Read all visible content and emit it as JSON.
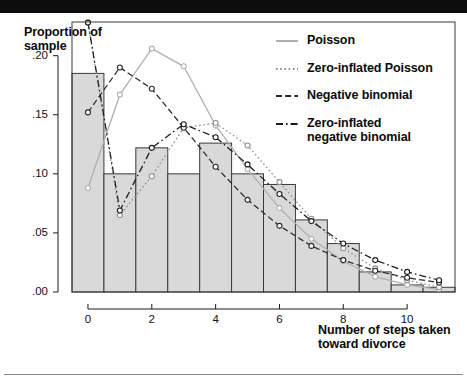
{
  "figure": {
    "y_axis_title": "Proportion\nof sample",
    "x_axis_title": "Number of steps\ntaken toward\ndivorce"
  },
  "legend": {
    "items": [
      {
        "label": "Poisson",
        "style": "solid",
        "color": "#b0b0b0"
      },
      {
        "label": "Zero-inflated Poisson",
        "style": "dotted",
        "color": "#8f8f8f"
      },
      {
        "label": "Negative binomial",
        "style": "dashed",
        "color": "#2a2a2a"
      },
      {
        "label": "Zero-inflated\nnegative binomial",
        "style": "dashdot",
        "color": "#1a1a1a"
      }
    ]
  },
  "chart_data": {
    "type": "bar",
    "title": "",
    "xlabel": "Number of steps taken toward divorce",
    "ylabel": "Proportion of sample",
    "categories": [
      0,
      1,
      2,
      3,
      4,
      5,
      6,
      7,
      8,
      9,
      10,
      11
    ],
    "values": [
      0.185,
      0.1,
      0.122,
      0.1,
      0.126,
      0.1,
      0.091,
      0.061,
      0.041,
      0.017,
      0.006,
      0.004
    ],
    "xlim": [
      -0.5,
      11.5
    ],
    "ylim": [
      0.0,
      0.2285
    ],
    "ytick_values": [
      0.0,
      0.05,
      0.1,
      0.15,
      0.2
    ],
    "ytick_labels": [
      ".00",
      ".05",
      ".10",
      ".15",
      ".20"
    ],
    "xtick_values": [
      0,
      2,
      4,
      6,
      8,
      10
    ],
    "xtick_labels": [
      "0",
      "2",
      "4",
      "6",
      "8",
      "10"
    ],
    "grid": false,
    "bar_fill": "#d9d9d9",
    "bar_edge": "#3a3a3a",
    "series": [
      {
        "name": "Poisson",
        "style": "solid",
        "color": "#b0b0b0",
        "x": [
          0,
          1,
          2,
          3,
          4,
          5,
          6,
          7,
          8,
          9,
          10,
          11
        ],
        "values": [
          0.088,
          0.167,
          0.206,
          0.191,
          0.141,
          0.104,
          0.071,
          0.045,
          0.026,
          0.013,
          0.006,
          0.002
        ]
      },
      {
        "name": "Zero-inflated Poisson",
        "style": "dotted",
        "color": "#8f8f8f",
        "x": [
          0,
          1,
          2,
          3,
          4,
          5,
          6,
          7,
          8,
          9,
          10,
          11
        ],
        "values": [
          0.228,
          0.065,
          0.098,
          0.139,
          0.143,
          0.124,
          0.093,
          0.062,
          0.037,
          0.02,
          0.01,
          0.004
        ]
      },
      {
        "name": "Negative binomial",
        "style": "dashed",
        "color": "#2a2a2a",
        "x": [
          0,
          1,
          2,
          3,
          4,
          5,
          6,
          7,
          8,
          9,
          10,
          11
        ],
        "values": [
          0.152,
          0.19,
          0.172,
          0.139,
          0.106,
          0.078,
          0.056,
          0.039,
          0.027,
          0.018,
          0.012,
          0.008
        ]
      },
      {
        "name": "Zero-inflated negative binomial",
        "style": "dashdot",
        "color": "#1a1a1a",
        "x": [
          0,
          1,
          2,
          3,
          4,
          5,
          6,
          7,
          8,
          9,
          10,
          11
        ],
        "values": [
          0.228,
          0.069,
          0.122,
          0.142,
          0.131,
          0.108,
          0.083,
          0.06,
          0.041,
          0.027,
          0.017,
          0.01
        ]
      }
    ]
  }
}
